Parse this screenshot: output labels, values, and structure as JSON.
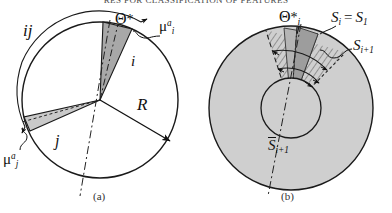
{
  "page": {
    "header_partial_text": "RES FOR CLASSIFICATION OF FEATURES",
    "background_color": "#ffffff",
    "ink_color": "#111111"
  },
  "figure": {
    "panels": [
      {
        "id": "a",
        "caption": "(a)",
        "description": "circle with two shaded angular sectors i and j, radius R and angular intervals",
        "labels": {
          "pair_label": "ij",
          "theta_star": "Θ",
          "theta_star_mark": "*",
          "theta_star_sub": "i",
          "mu_i": "μ",
          "mu_i_sup": "a",
          "mu_i_sub": "i",
          "mu_j": "μ",
          "mu_j_sup": "a",
          "mu_j_sub": "j",
          "sector_i": "i",
          "sector_j": "j",
          "radius": "R"
        },
        "colors": {
          "sector_i_fill": "#a8a8a8",
          "sector_j_fill": "#c9c9c9",
          "circle_stroke": "#1a1a1a",
          "circle_fill": "#ffffff"
        },
        "geometry": {
          "center_x": 100,
          "center_y": 100,
          "radius_px": 78,
          "sector_i_start_deg": 66,
          "sector_i_end_deg": 88,
          "sector_j_start_deg": 182,
          "sector_j_end_deg": 198
        }
      },
      {
        "id": "b",
        "caption": "(b)",
        "description": "gray annulus disk with inner circle, hatched and shaded sectors denoting S_i and S_i+1",
        "labels": {
          "theta_star": "Θ",
          "theta_star_mark": "*",
          "theta_star_sub": "i",
          "s_equality_left": "S",
          "s_equality_left_sub": "i",
          "s_equality_eq": "=",
          "s_equality_right": "S",
          "s_equality_right_sub": "1",
          "s_next": "S",
          "s_next_sub": "i+1",
          "s_bar": "S",
          "s_bar_sub": "i+1"
        },
        "colors": {
          "disk_fill": "#cfcfcf",
          "sector_dark_fill": "#9d9d9d",
          "sector_mid_fill": "#b5b5b5",
          "hatch_stroke": "#5a5a5a",
          "disk_stroke": "#1a1a1a"
        },
        "geometry": {
          "center_x": 291,
          "center_y": 108,
          "outer_radius_px": 82,
          "inner_radius_px": 30,
          "sector_start_deg": 60,
          "sector_end_deg": 100
        }
      }
    ]
  }
}
